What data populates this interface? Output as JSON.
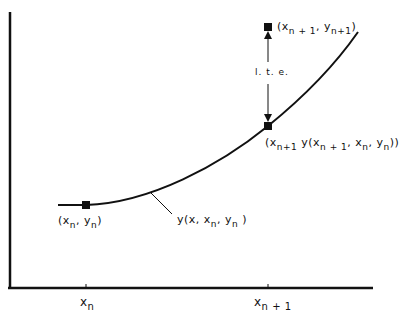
{
  "diagram": {
    "title": "",
    "axes": {
      "x_ticks": [
        {
          "name": "x",
          "sub": "n"
        },
        {
          "name": "x",
          "sub": "n + 1"
        }
      ]
    },
    "points": {
      "start": {
        "open": "(x",
        "sub1": "n",
        "mid": ",  y",
        "sub2": "n",
        "close": ")"
      },
      "exact_next": {
        "open": "(x",
        "sub1": "n + 1",
        "mid": ",  y",
        "sub2": "n+1",
        "close": ")"
      },
      "approx_next": {
        "open": "(x",
        "sub1": "n+1",
        "mid": "  y(x",
        "sub2": "n + 1",
        "mid2": ",  x",
        "sub3": "n",
        "mid3": ",  y",
        "sub4": "n",
        "close": "))"
      }
    },
    "curve_label": {
      "open": "y(x,  x",
      "sub1": "n",
      "mid": ",  y",
      "sub2": "n",
      "close": " )"
    },
    "error_label": "l. t. e.",
    "colors": {
      "ink": "#111111",
      "background": "#ffffff"
    }
  }
}
